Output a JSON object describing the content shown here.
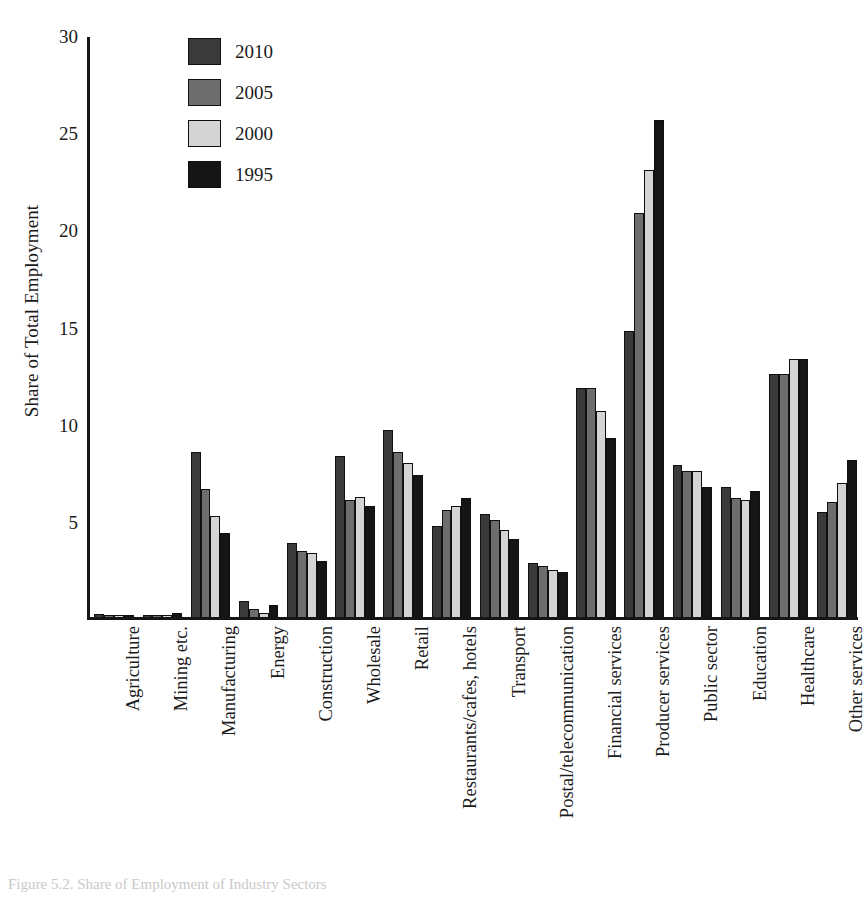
{
  "chart_data": {
    "type": "bar",
    "title": "",
    "xlabel": "",
    "ylabel": "Share of Total Employment",
    "ylim": [
      0,
      30
    ],
    "yticks": [
      5,
      10,
      15,
      20,
      25,
      30
    ],
    "grid": false,
    "legend_position": "top-left-inside",
    "categories": [
      "Agriculture",
      "Mining etc.",
      "Manufacturing",
      "Energy",
      "Construction",
      "Wholesale",
      "Retail",
      "Restaurants/cafes, hotels",
      "Transport",
      "Postal/telecommunication",
      "Financial services",
      "Producer services",
      "Public sector",
      "Education",
      "Healthcare",
      "Other services"
    ],
    "series": [
      {
        "name": "2010",
        "color": "#3a3a3a",
        "values": [
          0.15,
          0.1,
          8.5,
          0.8,
          3.8,
          8.3,
          9.6,
          4.7,
          5.3,
          2.8,
          11.8,
          14.7,
          7.8,
          6.7,
          12.5,
          5.4
        ]
      },
      {
        "name": "2005",
        "color": "#6e6e6e",
        "values": [
          0.1,
          0.1,
          6.6,
          0.4,
          3.4,
          6.0,
          8.5,
          5.5,
          5.0,
          2.6,
          11.8,
          20.8,
          7.5,
          6.1,
          12.5,
          5.9
        ]
      },
      {
        "name": "2000",
        "color": "#d4d4d4",
        "values": [
          0.1,
          0.1,
          5.2,
          0.2,
          3.3,
          6.2,
          7.9,
          5.7,
          4.5,
          2.4,
          10.6,
          23.0,
          7.5,
          6.0,
          13.3,
          6.9
        ]
      },
      {
        "name": "1995",
        "color": "#151515",
        "values": [
          0.1,
          0.2,
          4.3,
          0.6,
          2.9,
          5.7,
          7.3,
          6.1,
          4.0,
          2.3,
          9.2,
          25.6,
          6.7,
          6.5,
          13.3,
          8.1
        ]
      }
    ]
  },
  "caption": {
    "text": "Figure 5.2. Share of Employment of Industry Sectors"
  }
}
